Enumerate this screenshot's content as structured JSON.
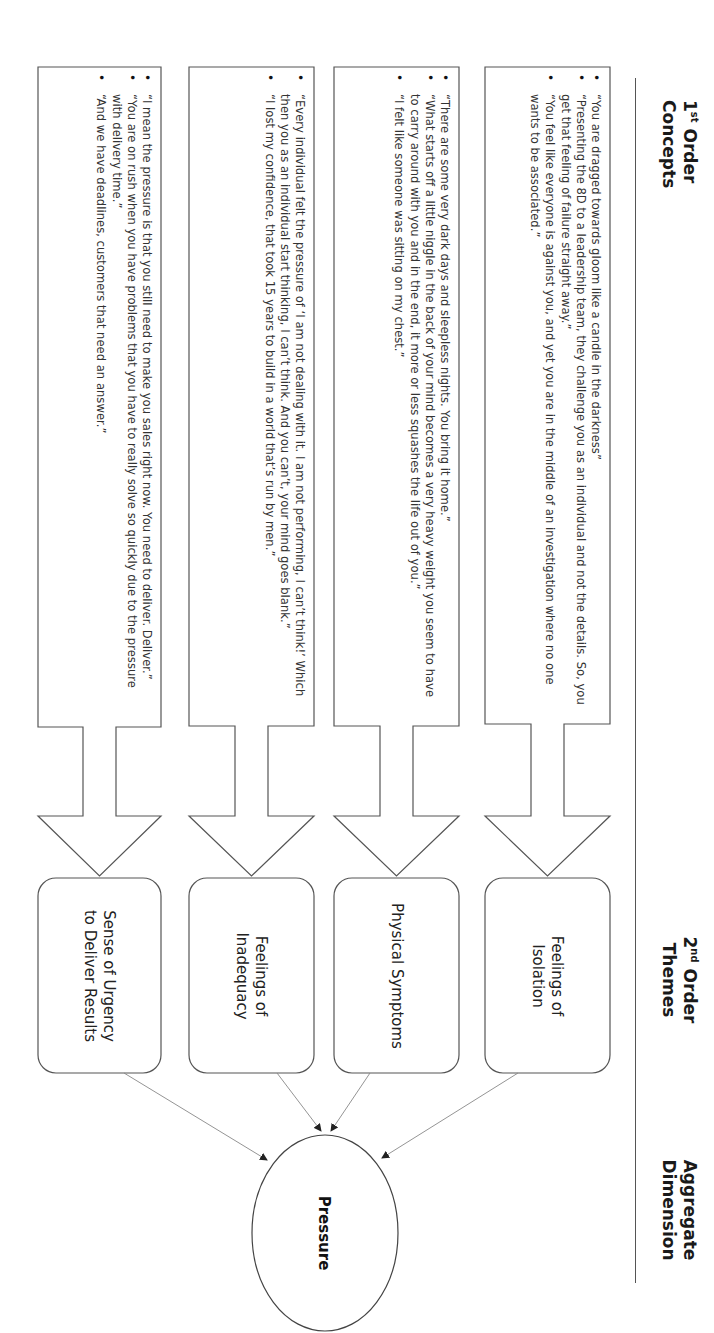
{
  "headers": {
    "first_order": {
      "num": "1",
      "sup": "st",
      "line1_rest": " Order",
      "line2": "Concepts"
    },
    "second_order": {
      "num": "2",
      "sup": "nd",
      "line1_rest": " Order",
      "line2": "Themes"
    },
    "aggregate": {
      "line1": "Aggregate",
      "line2": "Dimension"
    }
  },
  "colors": {
    "stroke": "#555555",
    "text": "#333333",
    "background": "#ffffff"
  },
  "rows": [
    {
      "theme": "Feelings of Isolation",
      "theme_lines": [
        "Feelings of",
        "Isolation"
      ],
      "quotes": [
        "“You are dragged towards gloom like a candle in the darkness”",
        "“Presenting the 8D to a leadership team, they challenge you as an individual and not the details. So, you get that feeling of failure straight away.”",
        "“You feel like everyone is against you, and yet you are in the middle of an investigation where no one wants to be associated.”"
      ]
    },
    {
      "theme": "Physical Symptoms",
      "theme_lines": [
        "Physical Symptoms"
      ],
      "quotes": [
        "“There are some very dark days and sleepless nights. You bring it home.”",
        "“What starts off a little niggle in the back of your mind becomes a very heavy weight you seem to have to carry around with you and in the end, it more or less squashes the life out of you.”",
        "“I felt like someone was sitting on my chest.”"
      ]
    },
    {
      "theme": "Feelings of Inadequacy",
      "theme_lines": [
        "Feelings of",
        "Inadequacy"
      ],
      "quotes": [
        "“Every individual felt the pressure of ‘I am not dealing with it. I am not performing, I can’t think!’ Which then you as an individual start thinking, I can’t think. And you can’t, your mind goes blank.”",
        "“I lost my confidence, that took 15 years to build in a world that’s run by men.”"
      ]
    },
    {
      "theme": "Sense of Urgency to Deliver Results",
      "theme_lines": [
        "Sense of Urgency",
        "to Deliver Results"
      ],
      "quotes": [
        "“I mean the pressure is that you still need to make you sales right now. You need to deliver. Deliver.”",
        "“You are on rush when you have problems that you have to really solve so quickly due to the pressure with delivery time.”",
        "“And we have deadlines, customers that need an answer.”"
      ]
    }
  ],
  "aggregate_dimension": {
    "label": "Pressure"
  }
}
